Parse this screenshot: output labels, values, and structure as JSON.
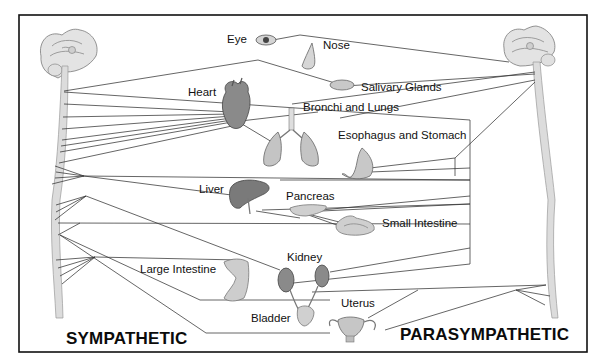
{
  "diagram": {
    "type": "autonomic-nervous-system-illustration",
    "divisions": {
      "left": "SYMPATHETIC",
      "right": "PARASYMPATHETIC"
    },
    "organs": [
      {
        "id": "eye",
        "label": "Eye"
      },
      {
        "id": "nose",
        "label": "Nose"
      },
      {
        "id": "salivary",
        "label": "Salivary Glands"
      },
      {
        "id": "heart",
        "label": "Heart"
      },
      {
        "id": "lungs",
        "label": "Bronchi and Lungs"
      },
      {
        "id": "stomach",
        "label": "Esophagus and Stomach"
      },
      {
        "id": "liver",
        "label": "Liver"
      },
      {
        "id": "pancreas",
        "label": "Pancreas"
      },
      {
        "id": "small_intestine",
        "label": "Small Intestine"
      },
      {
        "id": "kidney",
        "label": "Kidney"
      },
      {
        "id": "large_intestine",
        "label": "Large Intestine"
      },
      {
        "id": "uterus",
        "label": "Uterus"
      },
      {
        "id": "bladder",
        "label": "Bladder"
      }
    ],
    "colors": {
      "line": "#333333",
      "frame": "#111111",
      "organ_fill": "#bdbdbd",
      "organ_dark": "#6f6f6f",
      "spine": "#d9d9d9"
    }
  }
}
